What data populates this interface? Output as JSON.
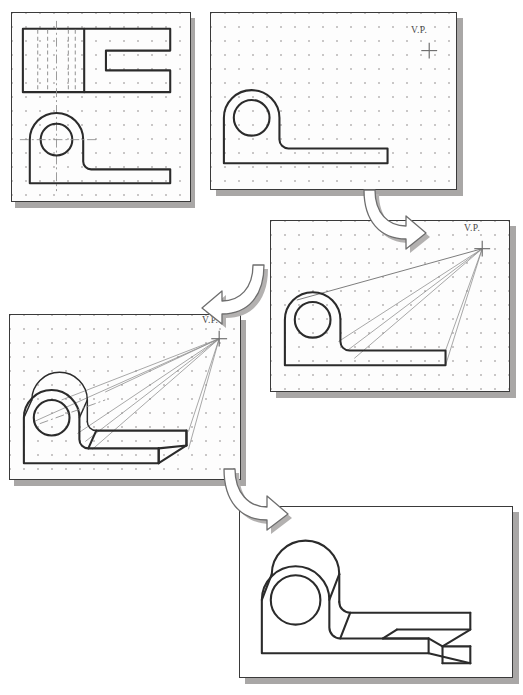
{
  "figure": {
    "background_color": "#ffffff",
    "line_color": "#2b2b2b",
    "grid_dot_color": "#c9c7c7",
    "shadow_color": "#a9a7a6"
  },
  "panels": [
    {
      "id": "panel-1",
      "step": 1,
      "name": "orthographic-views-panel",
      "caption": "",
      "has_grid": true,
      "has_vp": false,
      "vp_label": "",
      "contents": "Top view with hidden lines and front view with centerlines and bore circle"
    },
    {
      "id": "panel-2",
      "step": 2,
      "name": "front-face-with-vp-panel",
      "caption": "",
      "has_grid": true,
      "has_vp": true,
      "vp_label": "V.P.",
      "contents": "Front profile outline drawn with vanishing point marked top right"
    },
    {
      "id": "panel-3",
      "step": 3,
      "name": "projection-lines-panel",
      "caption": "",
      "has_grid": true,
      "has_vp": true,
      "vp_label": "V.P.",
      "contents": "Projection lines drawn from profile corners converging at the vanishing point"
    },
    {
      "id": "panel-4",
      "step": 4,
      "name": "depth-blocked-panel",
      "caption": "",
      "has_grid": true,
      "has_vp": true,
      "vp_label": "V.P.",
      "contents": "Depth established along projection lines producing the receding solid"
    },
    {
      "id": "panel-5",
      "step": 5,
      "name": "finished-perspective-panel",
      "caption": "",
      "has_grid": false,
      "has_vp": false,
      "vp_label": "",
      "contents": "Completed one-point perspective view with construction lines removed"
    }
  ],
  "arrows": [
    {
      "id": "arrow-1",
      "name": "flow-arrow-step2-to-step3",
      "direction": "down-right"
    },
    {
      "id": "arrow-2",
      "name": "flow-arrow-step3-to-step4",
      "direction": "down-left"
    },
    {
      "id": "arrow-3",
      "name": "flow-arrow-step4-to-step5",
      "direction": "down-right"
    }
  ],
  "labels": {
    "vanishing_point": "V.P."
  }
}
